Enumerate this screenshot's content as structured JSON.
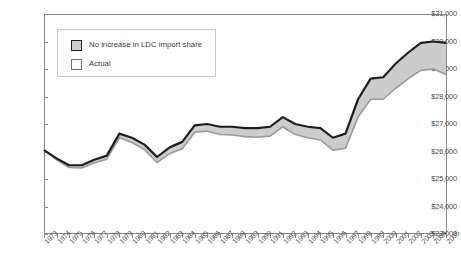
{
  "chart_data": {
    "type": "area",
    "title": "",
    "xlabel": "",
    "ylabel": "",
    "ylim": [
      23000,
      31000
    ],
    "ytick_values": [
      23000,
      24000,
      25000,
      26000,
      27000,
      28000,
      29000,
      30000,
      31000
    ],
    "ytick_labels": [
      "$23,000",
      "$24,000",
      "$25,000",
      "$26,000",
      "$27,000",
      "$28,000",
      "$29,000",
      "$30,000",
      "$31,000"
    ],
    "grid": false,
    "legend_position": "upper left inside plot",
    "categories": [
      "1973",
      "1974",
      "1975",
      "1976",
      "1977",
      "1978",
      "1979",
      "1980",
      "1981",
      "1982",
      "1983",
      "1984",
      "1985",
      "1986",
      "1987",
      "1988",
      "1989",
      "1990",
      "1991",
      "1992",
      "1993",
      "1994",
      "1995",
      "1996",
      "1997",
      "1998",
      "1999",
      "2000",
      "2001",
      "2002",
      "2003",
      "2004",
      "2005"
    ],
    "series": [
      {
        "name": "No increase in LDC import share",
        "line_color": "#1d1d1d",
        "values": [
          26050,
          25750,
          25500,
          25500,
          25700,
          25850,
          26650,
          26500,
          26250,
          25800,
          26150,
          26350,
          26950,
          27000,
          26900,
          26900,
          26850,
          26850,
          26900,
          27250,
          27000,
          26900,
          26850,
          26500,
          26650,
          27900,
          28650,
          28700,
          29200,
          29600,
          29950,
          30000,
          29950
        ]
      },
      {
        "name": "Actual",
        "line_color": "#9a9a9a",
        "values": [
          26050,
          25700,
          25420,
          25400,
          25580,
          25720,
          26500,
          26330,
          26070,
          25600,
          25920,
          26100,
          26700,
          26740,
          26620,
          26600,
          26540,
          26520,
          26560,
          26900,
          26620,
          26500,
          26420,
          26050,
          26120,
          27250,
          27900,
          27900,
          28300,
          28650,
          28950,
          29000,
          28800
        ]
      }
    ],
    "fill_between_color": "#cccccc"
  },
  "legend": {
    "items": [
      {
        "label": "No increase in LDC import share",
        "swatch": "shaded"
      },
      {
        "label": "Actual",
        "swatch": "outline"
      }
    ]
  },
  "colors": {
    "axis": "#8a8a8a",
    "upper_line": "#1d1d1d",
    "lower_line": "#9a9a9a",
    "band_fill": "#cccccc",
    "text": "#3b3b3b",
    "background": "#ffffff"
  }
}
